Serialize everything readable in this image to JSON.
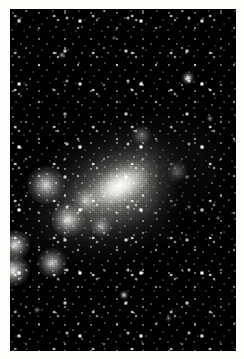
{
  "image": {
    "kind": "astronomical-photograph",
    "subject": "irregular dwarf galaxy resolved into stars",
    "orientation": "portrait",
    "width_px": 244,
    "height_px": 359,
    "color_mode": "grayscale",
    "paper_background": "#fdfdfb",
    "plate": {
      "left_px": 10,
      "top_px": 9,
      "width_px": 226,
      "height_px": 342,
      "background": "#050505",
      "border": "none"
    }
  },
  "palette": {
    "paper_white": "#fdfdfb",
    "sky_black": "#050505",
    "deep_shadow": "#0b0b0b",
    "mid_gray": "#6e6e6c",
    "halo_gray": "#9a9a98",
    "bright_gray": "#d2d2cf",
    "core_white": "#faf8f6",
    "star_white": "#ffffff"
  },
  "features": {
    "core": {
      "label": "galaxy-core",
      "center_pct": {
        "x": 47.5,
        "y": 51
      },
      "position_angle_deg": -28,
      "semi_major_px": 44,
      "semi_minor_px": 25,
      "peak_brightness": "#faf8f6"
    },
    "halo": {
      "label": "diffuse-halo",
      "position_angle_deg": -25,
      "semi_major_px": 150,
      "semi_minor_px": 92,
      "falloff": "radial, fading to sky at plate edges"
    },
    "dust_lane": {
      "label": "dark-dust-lane",
      "side": "right-of-core",
      "center_pct": {
        "x": 74,
        "y": 54
      },
      "opacity": 0.55
    },
    "knots": [
      {
        "name": "knot-left-upper",
        "x_pct": 15.9,
        "y_pct": 51.5,
        "radius_px": 9,
        "intensity": 0.8
      },
      {
        "name": "knot-left-cluster",
        "x_pct": 25.7,
        "y_pct": 61.7,
        "radius_px": 8,
        "intensity": 0.82
      },
      {
        "name": "knot-left-edge-a",
        "x_pct": 2.2,
        "y_pct": 69.0,
        "radius_px": 7,
        "intensity": 0.86
      },
      {
        "name": "knot-left-edge-b",
        "x_pct": 1.3,
        "y_pct": 76.5,
        "radius_px": 8,
        "intensity": 0.92
      },
      {
        "name": "knot-lower-left",
        "x_pct": 18.6,
        "y_pct": 74.3,
        "radius_px": 7,
        "intensity": 0.78
      },
      {
        "name": "knot-inner-west",
        "x_pct": 33.6,
        "y_pct": 56.0,
        "radius_px": 6,
        "intensity": 0.62
      },
      {
        "name": "knot-south-core",
        "x_pct": 40.7,
        "y_pct": 63.5,
        "radius_px": 5,
        "intensity": 0.58
      },
      {
        "name": "knot-north-arm",
        "x_pct": 58.4,
        "y_pct": 37.0,
        "radius_px": 5,
        "intensity": 0.42
      },
      {
        "name": "knot-east-faint",
        "x_pct": 74.3,
        "y_pct": 47.5,
        "radius_px": 5,
        "intensity": 0.34
      }
    ],
    "foreground_stars": [
      {
        "name": "star-bright-ne",
        "x_pct": 78.8,
        "y_pct": 20.2,
        "radius_px": 2.6,
        "intensity": 1.0
      },
      {
        "name": "star-south",
        "x_pct": 50.4,
        "y_pct": 83.6,
        "radius_px": 2.0,
        "intensity": 0.92
      },
      {
        "name": "star-nw",
        "x_pct": 23.0,
        "y_pct": 13.5,
        "radius_px": 1.6,
        "intensity": 0.7
      },
      {
        "name": "star-ne-faint",
        "x_pct": 88.5,
        "y_pct": 32.0,
        "radius_px": 1.4,
        "intensity": 0.62
      },
      {
        "name": "star-sw",
        "x_pct": 12.0,
        "y_pct": 88.0,
        "radius_px": 1.4,
        "intensity": 0.6
      },
      {
        "name": "star-se",
        "x_pct": 70.0,
        "y_pct": 90.5,
        "radius_px": 1.3,
        "intensity": 0.55
      },
      {
        "name": "star-n-center",
        "x_pct": 46.0,
        "y_pct": 8.5,
        "radius_px": 1.3,
        "intensity": 0.55
      },
      {
        "name": "star-e-mid",
        "x_pct": 92.0,
        "y_pct": 61.0,
        "radius_px": 1.2,
        "intensity": 0.5
      }
    ]
  },
  "texture": {
    "grain": "photographic emulsion grain, coarse",
    "resolved_stars": "dense field of point sources across entire plate",
    "grain_opacity": 0.42
  }
}
